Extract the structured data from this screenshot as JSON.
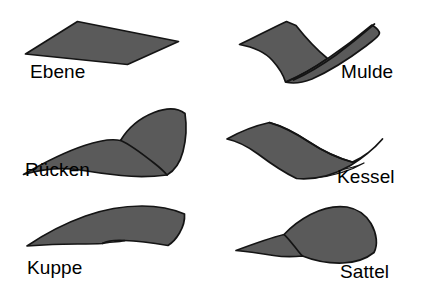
{
  "figure": {
    "colors": {
      "surface_fill": "#5a5a5a",
      "surface_outline": "#141414",
      "surface_shade": "#b9b9b9",
      "background": "#ffffff",
      "label_text": "#000000"
    }
  },
  "forms": [
    {
      "id": "ebene",
      "label": "Ebene",
      "shape": "plane",
      "row": 1,
      "column": 1,
      "label_x": 30,
      "label_y": 62
    },
    {
      "id": "mulde",
      "label": "Mulde",
      "shape": "concave-trough",
      "row": 1,
      "column": 2,
      "label_x": 341,
      "label_y": 62
    },
    {
      "id": "ruecken",
      "label": "Rücken",
      "shape": "convex-ridge",
      "row": 2,
      "column": 1,
      "label_x": 25,
      "label_y": 160
    },
    {
      "id": "kessel",
      "label": "Kessel",
      "shape": "concave-basin",
      "row": 2,
      "column": 2,
      "label_x": 337,
      "label_y": 167
    },
    {
      "id": "kuppe",
      "label": "Kuppe",
      "shape": "convex-dome",
      "row": 3,
      "column": 1,
      "label_x": 27,
      "label_y": 258
    },
    {
      "id": "sattel",
      "label": "Sattel",
      "shape": "saddle",
      "row": 3,
      "column": 2,
      "label_x": 340,
      "label_y": 262
    }
  ]
}
